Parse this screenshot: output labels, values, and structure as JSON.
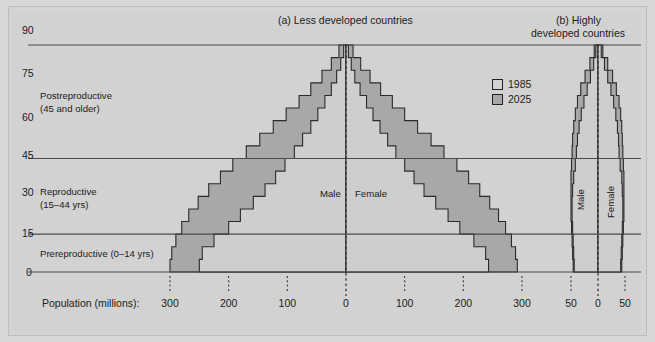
{
  "figure": {
    "background_color": "#d2d2d2",
    "frame_color": "#bdbdbd"
  },
  "panels": {
    "a_title": "(a) Less developed countries",
    "b_title_line1": "(b) Highly",
    "b_title_line2": "developed countries"
  },
  "legend": {
    "items": [
      {
        "label": "1985",
        "color": "#d2d2d2"
      },
      {
        "label": "2025",
        "color": "#a8a8a8"
      }
    ]
  },
  "yaxis": {
    "ticks": [
      "90",
      "75",
      "60",
      "45",
      "30",
      "15",
      "0"
    ],
    "values": [
      90,
      75,
      60,
      45,
      30,
      15,
      0
    ],
    "rule_values": [
      90,
      45,
      15,
      0
    ]
  },
  "age_categories": [
    {
      "name": "Postreproductive",
      "detail": "(45 and older)"
    },
    {
      "name": "Reproductive",
      "detail": "(15–44 yrs)"
    },
    {
      "name": "Prereproductive (0–14 yrs)",
      "detail": ""
    }
  ],
  "xaxis": {
    "caption": "Population (millions):",
    "panel_a_ticks": [
      "300",
      "200",
      "100",
      "0",
      "100",
      "200",
      "300"
    ],
    "panel_a_values": [
      -300,
      -200,
      -100,
      0,
      100,
      200,
      300
    ],
    "panel_b_ticks": [
      "50",
      "0",
      "50"
    ],
    "panel_b_values": [
      -50,
      0,
      50
    ]
  },
  "sex_labels": {
    "male": "Male",
    "female": "Female"
  },
  "chart_data": {
    "type": "area",
    "xlabel": "Population (millions)",
    "ylabel": "Age (years)",
    "grid": false,
    "legend_position": "top-right",
    "panels": [
      {
        "name": "(a) Less developed countries",
        "xlim": [
          -330,
          330
        ],
        "ylim": [
          0,
          90
        ],
        "age_bins": [
          "0-4",
          "5-9",
          "10-14",
          "15-19",
          "20-24",
          "25-29",
          "30-34",
          "35-39",
          "40-44",
          "45-49",
          "50-54",
          "55-59",
          "60-64",
          "65-69",
          "70-74",
          "75-79",
          "80-84",
          "85+"
        ],
        "series": [
          {
            "name": "1985",
            "male_values": [
              -250,
              -245,
              -225,
              -200,
              -180,
              -158,
              -138,
              -120,
              -104,
              -88,
              -74,
              -60,
              -48,
              -36,
              -25,
              -16,
              -9,
              -4
            ],
            "female_values": [
              243,
              238,
              218,
              194,
              174,
              153,
              133,
              116,
              100,
              85,
              71,
              58,
              46,
              35,
              24,
              15,
              9,
              4
            ]
          },
          {
            "name": "2025",
            "male_values": [
              -300,
              -297,
              -290,
              -280,
              -268,
              -252,
              -234,
              -214,
              -193,
              -170,
              -147,
              -124,
              -102,
              -80,
              -60,
              -41,
              -25,
              -12
            ],
            "female_values": [
              292,
              289,
              282,
              272,
              260,
              245,
              228,
              209,
              189,
              167,
              145,
              122,
              100,
              79,
              59,
              41,
              25,
              12
            ]
          }
        ]
      },
      {
        "name": "(b) Highly developed countries",
        "xlim": [
          -56,
          56
        ],
        "ylim": [
          0,
          90
        ],
        "age_bins": [
          "0-4",
          "5-9",
          "10-14",
          "15-19",
          "20-24",
          "25-29",
          "30-34",
          "35-39",
          "40-44",
          "45-49",
          "50-54",
          "55-59",
          "60-64",
          "65-69",
          "70-74",
          "75-79",
          "80-84",
          "85+"
        ],
        "series": [
          {
            "name": "1985",
            "male_values": [
              -44,
              -45,
              -46,
              -47,
              -48,
              -48,
              -47,
              -45,
              -42,
              -40,
              -38,
              -35,
              -31,
              -26,
              -20,
              -14,
              -8,
              -4
            ],
            "female_values": [
              42,
              43,
              44,
              45,
              46,
              46,
              45,
              44,
              41,
              39,
              38,
              36,
              33,
              29,
              24,
              18,
              12,
              6
            ]
          },
          {
            "name": "2025",
            "male_values": [
              -46,
              -47,
              -48,
              -49,
              -50,
              -50,
              -50,
              -50,
              -49,
              -48,
              -47,
              -45,
              -42,
              -38,
              -32,
              -24,
              -15,
              -7
            ],
            "female_values": [
              44,
              45,
              46,
              47,
              48,
              48,
              48,
              48,
              47,
              46,
              45,
              44,
              42,
              39,
              34,
              27,
              18,
              9
            ]
          }
        ]
      }
    ]
  }
}
